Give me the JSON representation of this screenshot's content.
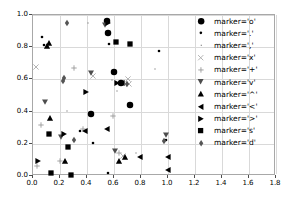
{
  "chart_data": {
    "type": "scatter",
    "title": "",
    "xlabel": "",
    "ylabel": "",
    "xlim": [
      0.0,
      1.8
    ],
    "ylim": [
      0.0,
      1.0
    ],
    "xticks": [
      "0.0",
      "0.2",
      "0.4",
      "0.6",
      "0.8",
      "1.0",
      "1.2",
      "1.4",
      "1.6",
      "1.8"
    ],
    "xtick_values": [
      0.0,
      0.2,
      0.4,
      0.6,
      0.8,
      1.0,
      1.2,
      1.4,
      1.6,
      1.8
    ],
    "yticks": [
      "0.0",
      "0.2",
      "0.4",
      "0.6",
      "0.8",
      "1.0"
    ],
    "ytick_values": [
      0.0,
      0.2,
      0.4,
      0.6,
      0.8,
      1.0
    ],
    "grid": true,
    "legend_position": "upper right",
    "marker_color": "#000000",
    "grid_color": "#d9d9d9",
    "axis_color": "#a8a8a8",
    "series": [
      {
        "name": "marker='o'",
        "marker": "o",
        "legend_label": "marker='o'",
        "size": 6.5,
        "color": "#000000",
        "points": [
          [
            0.545,
            0.96
          ],
          [
            0.555,
            0.888
          ],
          [
            0.6,
            0.645
          ],
          [
            0.432,
            0.383
          ],
          [
            0.65,
            0.578
          ],
          [
            0.718,
            0.44
          ]
        ]
      },
      {
        "name": "marker='.'",
        "marker": ".",
        "legend_label": "marker='.'",
        "size": 2.6,
        "color": "#000000",
        "points": [
          [
            0.065,
            0.862
          ],
          [
            0.56,
            0.822
          ],
          [
            0.93,
            0.778
          ],
          [
            0.445,
            0.208
          ],
          [
            0.555,
            0.018
          ],
          [
            0.985,
            0.222
          ],
          [
            0.348,
            0.282
          ],
          [
            0.078,
            0.812
          ]
        ]
      },
      {
        "name": "marker=','",
        "marker": ",",
        "legend_label": "marker=','",
        "size": 1.2,
        "color": "#888888",
        "points": [
          [
            0.41,
            0.948
          ],
          [
            0.585,
            0.598
          ],
          [
            0.62,
            0.525
          ],
          [
            0.905,
            0.662
          ],
          [
            0.255,
            0.405
          ],
          [
            0.76,
            0.142
          ]
        ]
      },
      {
        "name": "marker='x'",
        "marker": "x",
        "legend_label": "marker='x'",
        "size": 5.2,
        "color": "#aaaaaa",
        "points": [
          [
            0.022,
            0.68
          ],
          [
            0.448,
            0.622
          ],
          [
            0.7,
            0.6
          ],
          [
            0.668,
            0.122
          ],
          [
            0.712,
            0.57
          ]
        ]
      },
      {
        "name": "marker='+'",
        "marker": "+",
        "legend_label": "marker='+'",
        "size": 5.4,
        "color": "#999999",
        "points": [
          [
            0.305,
            0.668
          ],
          [
            0.058,
            0.315
          ],
          [
            0.592,
            0.372
          ],
          [
            0.368,
            0.29
          ],
          [
            0.2,
            0.092
          ],
          [
            0.64,
            0.14
          ],
          [
            0.028,
            0.062
          ]
        ]
      },
      {
        "name": "marker='v'",
        "marker": "v",
        "legend_label": "marker='v'",
        "size": 6.0,
        "color": "#4d4d4d",
        "points": [
          [
            0.432,
            0.64
          ],
          [
            0.088,
            0.462
          ],
          [
            0.205,
            0.245
          ],
          [
            0.61,
            0.158
          ],
          [
            0.985,
            0.252
          ],
          [
            0.535,
            0.935
          ]
        ]
      },
      {
        "name": "marker='^'",
        "marker": "^",
        "legend_label": "marker='^'",
        "size": 6.2,
        "color": "#000000",
        "points": [
          [
            0.122,
            0.825
          ],
          [
            0.1,
            0.808
          ],
          [
            0.128,
            0.362
          ],
          [
            0.235,
            0.092
          ],
          [
            0.638,
            0.092
          ],
          [
            0.68,
            0.115
          ]
        ]
      },
      {
        "name": "marker='<'",
        "marker": "<",
        "legend_label": "marker='<'",
        "size": 6.2,
        "color": "#000000",
        "points": [
          [
            0.388,
            0.278
          ],
          [
            0.548,
            0.292
          ],
          [
            0.79,
            0.118
          ],
          [
            0.998,
            0.118
          ],
          [
            1.0,
            0.04
          ],
          [
            0.66,
            0.578
          ]
        ]
      },
      {
        "name": "marker='>'",
        "marker": ">",
        "legend_label": "marker='>'",
        "size": 6.2,
        "color": "#000000",
        "points": [
          [
            0.392,
            0.522
          ],
          [
            0.228,
            0.258
          ],
          [
            0.04,
            0.092
          ],
          [
            0.555,
            0.952
          ],
          [
            0.622,
            0.58
          ]
        ]
      },
      {
        "name": "marker='s'",
        "marker": "s",
        "legend_label": "marker='s'",
        "size": 6.0,
        "color": "#000000",
        "points": [
          [
            0.718,
            0.822
          ],
          [
            0.612,
            0.83
          ],
          [
            0.135,
            0.018
          ],
          [
            0.258,
            0.182
          ],
          [
            0.285,
            0.008
          ],
          [
            0.118,
            0.262
          ]
        ]
      },
      {
        "name": "marker='d'",
        "marker": "d",
        "legend_label": "marker='d'",
        "size": 6.5,
        "color": "#555555",
        "points": [
          [
            0.252,
            0.95
          ],
          [
            0.222,
            0.592
          ],
          [
            0.232,
            0.608
          ],
          [
            0.698,
            0.572
          ],
          [
            0.305,
            0.222
          ],
          [
            0.972,
            0.218
          ]
        ]
      }
    ]
  },
  "legend": {
    "entries": [
      {
        "label": "marker='o'",
        "marker": "o"
      },
      {
        "label": "marker='.'",
        "marker": "."
      },
      {
        "label": "marker=','",
        "marker": ","
      },
      {
        "label": "marker='x'",
        "marker": "x"
      },
      {
        "label": "marker='+'",
        "marker": "+"
      },
      {
        "label": "marker='v'",
        "marker": "v"
      },
      {
        "label": "marker='^'",
        "marker": "^"
      },
      {
        "label": "marker='<'",
        "marker": "<"
      },
      {
        "label": "marker='>'",
        "marker": ">"
      },
      {
        "label": "marker='s'",
        "marker": "s"
      },
      {
        "label": "marker='d'",
        "marker": "d"
      }
    ]
  }
}
